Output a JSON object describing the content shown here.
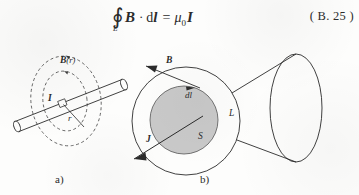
{
  "equation": {
    "integral_symbol": "∮",
    "contour_subscript": "L",
    "field_vector": "B",
    "dot_operator": "·",
    "differential_d": "d",
    "differential_l": "l",
    "equals": "=",
    "mu": "μ",
    "mu_subscript": "0",
    "current_vector": "I",
    "number": "( B. 25 )",
    "plain_text": "∮L B · dl = μ0 I"
  },
  "figures": {
    "a": {
      "caption": "a)",
      "labels": {
        "field": "B(r)",
        "field_bold_part": "B",
        "field_arg_part": "(r)",
        "current": "I",
        "radius": "r"
      },
      "description": "straight current-carrying wire with two concentric dashed circular field lines"
    },
    "b": {
      "caption": "b)",
      "labels": {
        "field_vector": "B",
        "line_element": "dl",
        "current_density": "J",
        "surface": "S",
        "contour": "L"
      },
      "description": "cylindrical conductor with shaded cross-section S bounded by contour L, vectors B and J"
    }
  },
  "colors": {
    "ink": "#2b2b2b",
    "paper": "#fdfdfc",
    "shaded_disk": "#c9c9c9",
    "dashed_line": "#4a4a4a"
  }
}
